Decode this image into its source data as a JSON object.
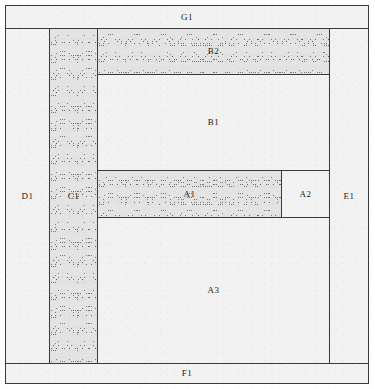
{
  "diagram": {
    "frame": {
      "x": 5,
      "y": 5,
      "width": 364,
      "height": 379
    },
    "colors": {
      "line": "#3a3a3a",
      "plain_fill": "#f2f2f2",
      "hatch_fill": "#e4e4e4",
      "hatch_stroke": "#5a5a5a",
      "label_text": "#222222",
      "paper": "#ffffff"
    },
    "regions": [
      {
        "id": "G1",
        "label": "G1",
        "fill": "plain",
        "x": 5,
        "y": 5,
        "width": 364,
        "height": 24,
        "role": "top-band"
      },
      {
        "id": "D1",
        "label": "D1",
        "fill": "plain",
        "x": 5,
        "y": 28,
        "width": 45,
        "height": 336,
        "role": "left-column"
      },
      {
        "id": "C1",
        "label": "C1",
        "fill": "hatched",
        "x": 49,
        "y": 28,
        "width": 49,
        "height": 336,
        "role": "hatched-vertical-column"
      },
      {
        "id": "B2",
        "label": "B2",
        "fill": "hatched",
        "x": 97,
        "y": 28,
        "width": 233,
        "height": 47,
        "role": "upper-hatched-band"
      },
      {
        "id": "B1",
        "label": "B1",
        "fill": "plain",
        "x": 97,
        "y": 74,
        "width": 233,
        "height": 97,
        "role": "upper-plain-block"
      },
      {
        "id": "A1",
        "label": "A1",
        "fill": "hatched",
        "x": 97,
        "y": 170,
        "width": 185,
        "height": 48,
        "role": "middle-hatched-band"
      },
      {
        "id": "A2",
        "label": "A2",
        "fill": "plain",
        "x": 281,
        "y": 170,
        "width": 49,
        "height": 48,
        "role": "middle-right-block"
      },
      {
        "id": "A3",
        "label": "A3",
        "fill": "plain",
        "x": 97,
        "y": 217,
        "width": 233,
        "height": 147,
        "role": "lower-plain-block"
      },
      {
        "id": "E1",
        "label": "E1",
        "fill": "plain",
        "x": 329,
        "y": 28,
        "width": 40,
        "height": 336,
        "role": "right-column"
      },
      {
        "id": "F1",
        "label": "F1",
        "fill": "plain",
        "x": 5,
        "y": 363,
        "width": 364,
        "height": 21,
        "role": "bottom-band"
      }
    ]
  }
}
